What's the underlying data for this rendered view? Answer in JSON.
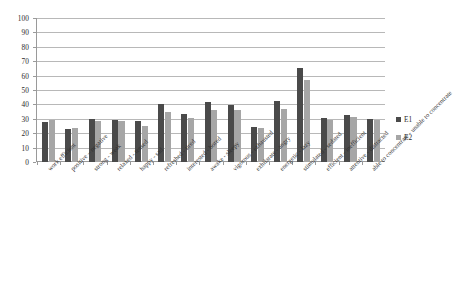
{
  "chart_data": {
    "type": "bar",
    "title": "",
    "subtitle": "",
    "xlabel": "",
    "ylabel": "",
    "ylim": [
      0,
      100
    ],
    "ytick_step": 10,
    "yticks": [
      0,
      10,
      20,
      30,
      40,
      50,
      60,
      70,
      80,
      90,
      100
    ],
    "grid": true,
    "grid_axis": "y",
    "legend_position": "right",
    "categories": [
      "work efficient",
      "positive – negative",
      "strong - weak",
      "relaxed - tensed",
      "happy - sad",
      "refreshed - tired",
      "interested - bored",
      "awake - sleepy",
      "vigorous - exhausted",
      "exhilarate - angry",
      "energetic - lazy",
      "stimulated - sedated",
      "efficient - inefficient",
      "attentive - distracted",
      "able to concentrate - unable to concentrate"
    ],
    "series": [
      {
        "name": "E1",
        "color": "#4a4a4a",
        "values": [
          28,
          23,
          30,
          29.5,
          28.5,
          40.5,
          33.5,
          41.5,
          39.5,
          24,
          42.5,
          65,
          30.5,
          32.5,
          30
        ]
      },
      {
        "name": "E2",
        "color": "#a6a6a6",
        "values": [
          29,
          23.5,
          28.5,
          28.5,
          25,
          35,
          30.5,
          36,
          36,
          23.5,
          37,
          57,
          29.5,
          31,
          29.5
        ]
      }
    ]
  },
  "legend": {
    "items": [
      {
        "label": "E1",
        "color": "#4a4a4a"
      },
      {
        "label": "E2",
        "color": "#a6a6a6"
      }
    ]
  },
  "axis": {
    "y_tick_labels": [
      "100",
      "90",
      "80",
      "70",
      "60",
      "50",
      "40",
      "30",
      "20",
      "10",
      "0"
    ]
  }
}
